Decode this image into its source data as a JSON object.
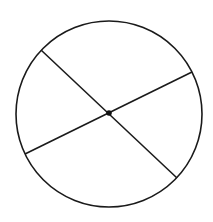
{
  "diagram": {
    "title": "",
    "stroke_color": "#1a1a1a",
    "background_color": "#ffffff",
    "elements": {
      "circle": "circle-outline",
      "diameters": [
        "diameter-1",
        "diameter-2"
      ],
      "center": "center-point"
    }
  }
}
